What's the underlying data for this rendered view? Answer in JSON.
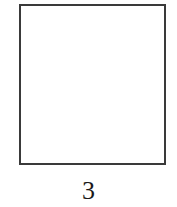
{
  "figure": {
    "shape": "square",
    "label": "3",
    "stroke_color": "#3a3a3a",
    "fill_color": "#ffffff"
  }
}
